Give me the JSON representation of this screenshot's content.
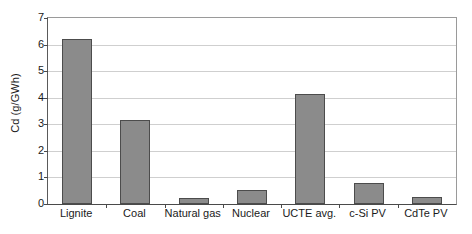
{
  "chart_data": {
    "type": "bar",
    "title": "",
    "xlabel": "",
    "ylabel": "Cd (g/GWh)",
    "categories": [
      "Lignite",
      "Coal",
      "Natural gas",
      "Nuclear",
      "UCTE avg.",
      "c-Si PV",
      "CdTe PV"
    ],
    "values": [
      6.2,
      3.15,
      0.22,
      0.53,
      4.15,
      0.78,
      0.27
    ],
    "ylim": [
      0,
      7
    ],
    "ytick_labels": [
      "0",
      "1",
      "2",
      "3",
      "4",
      "5",
      "6",
      "7"
    ],
    "ytick_values": [
      0,
      1,
      2,
      3,
      4,
      5,
      6,
      7
    ],
    "grid": true,
    "legend": false,
    "bar_color": "#8b8b8b",
    "bar_edge_color": "#4c4c4c",
    "grid_color": "#cfcfcf",
    "axis_color": "#4a4a4a",
    "background": "#ffffff"
  }
}
